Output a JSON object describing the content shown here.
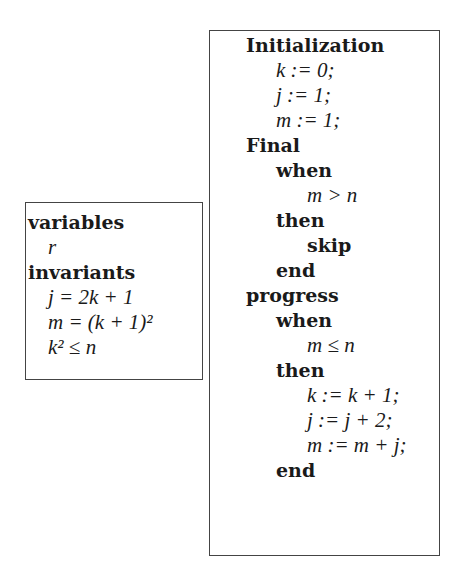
{
  "left_box": {
    "lines": [
      {
        "text": "variables",
        "kind": "keyword",
        "indent": 0
      },
      {
        "text": "r",
        "kind": "math",
        "indent": 1
      },
      {
        "text": "invariants",
        "kind": "keyword",
        "indent": 0
      },
      {
        "text": "j = 2k + 1",
        "kind": "math",
        "indent": 1
      },
      {
        "text": "m = (k + 1)²",
        "kind": "math",
        "indent": 1
      },
      {
        "text": "k² ≤ n",
        "kind": "math",
        "indent": 1
      }
    ]
  },
  "right_box": {
    "lines": [
      {
        "text": "Initialization",
        "kind": "keyword",
        "indent": 0
      },
      {
        "text": "k := 0;",
        "kind": "math",
        "indent": 1
      },
      {
        "text": "j := 1;",
        "kind": "math",
        "indent": 1
      },
      {
        "text": "m := 1;",
        "kind": "math",
        "indent": 1
      },
      {
        "text": "Final",
        "kind": "keyword",
        "indent": 0
      },
      {
        "text": "when",
        "kind": "keyword",
        "indent": 1
      },
      {
        "text": "m > n",
        "kind": "math",
        "indent": 2
      },
      {
        "text": "then",
        "kind": "keyword",
        "indent": 1
      },
      {
        "text": "skip",
        "kind": "keyword",
        "indent": 2
      },
      {
        "text": "end",
        "kind": "keyword",
        "indent": 1
      },
      {
        "text": "progress",
        "kind": "keyword",
        "indent": 0
      },
      {
        "text": "when",
        "kind": "keyword",
        "indent": 1
      },
      {
        "text": "m ≤ n",
        "kind": "math",
        "indent": 2
      },
      {
        "text": "then",
        "kind": "keyword",
        "indent": 1
      },
      {
        "text": "k := k + 1;",
        "kind": "math",
        "indent": 2
      },
      {
        "text": "j := j + 2;",
        "kind": "math",
        "indent": 2
      },
      {
        "text": "m := m + j;",
        "kind": "math",
        "indent": 2
      },
      {
        "text": "end",
        "kind": "keyword",
        "indent": 1
      }
    ]
  }
}
